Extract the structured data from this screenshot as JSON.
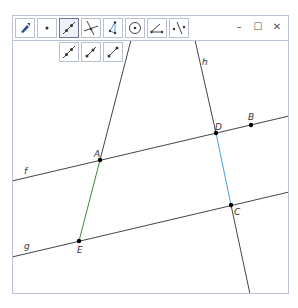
{
  "toolbar": {
    "tools": [
      {
        "name": "move",
        "icon": "arrow-icon"
      },
      {
        "name": "point",
        "icon": "point-icon"
      },
      {
        "name": "line",
        "icon": "line-icon",
        "active": true
      },
      {
        "name": "perpendicular-line",
        "icon": "perpendicular-icon"
      },
      {
        "name": "polygon",
        "icon": "polygon-icon"
      },
      {
        "name": "circle",
        "icon": "circle-icon"
      },
      {
        "name": "angle",
        "icon": "angle-icon"
      },
      {
        "name": "reflect",
        "icon": "reflect-icon"
      }
    ],
    "subtools": [
      {
        "name": "line",
        "icon": "line-icon"
      },
      {
        "name": "segment",
        "icon": "segment-icon"
      },
      {
        "name": "ray",
        "icon": "ray-icon"
      }
    ]
  },
  "window_controls": {
    "minimize": "–",
    "maximize": "☐",
    "close": "✕"
  },
  "geometry": {
    "line_labels": {
      "f": "f",
      "g": "g",
      "h": "h"
    },
    "points": {
      "A": "A",
      "B": "B",
      "C": "C",
      "D": "D",
      "E": "E"
    },
    "colors": {
      "line": "#333333",
      "segment_AE": "#3a8a3a",
      "segment_DC": "#4a9fd8",
      "point": "#000000"
    }
  }
}
